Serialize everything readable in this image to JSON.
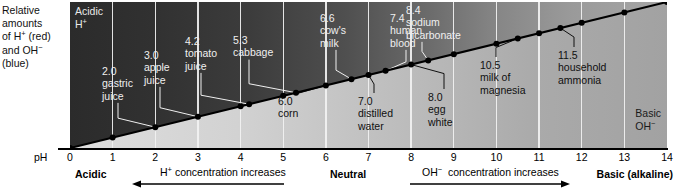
{
  "side_caption": {
    "lines": [
      "Relative",
      "amounts",
      "of H+ (red)",
      "and OH-",
      "(blue)"
    ]
  },
  "panel": {
    "acidic_corner": {
      "line1": "Acidic",
      "line2": "H+"
    },
    "basic_corner": {
      "line1": "Basic",
      "line2": "OH-"
    }
  },
  "axis": {
    "label": "pH",
    "ticks": [
      "0",
      "1",
      "2",
      "3",
      "4",
      "5",
      "6",
      "7",
      "8",
      "9",
      "10",
      "11",
      "12",
      "13",
      "14"
    ]
  },
  "legend": {
    "acidic": "Acidic",
    "neutral": "Neutral",
    "basic": "Basic (alkaline)",
    "h_plus_text": "H+ concentration increases",
    "oh_minus_text": "OH- concentration increases",
    "h_plus_direction": "left",
    "oh_minus_direction": "right"
  },
  "colors": {
    "acid_dark": "#2b2b2b",
    "base_light": "#dedede",
    "gridline": "#f2f2f2",
    "line": "#000000"
  },
  "chart_data": {
    "type": "line",
    "xlabel": "pH",
    "ylabel": "Relative amounts of H+ (red) and OH- (blue)",
    "xlim": [
      0,
      14
    ],
    "ylim": [
      0,
      1
    ],
    "grid": true,
    "legend_position": "bottom",
    "x": [
      0,
      1,
      2,
      3,
      4,
      5,
      6,
      7,
      8,
      9,
      10,
      11,
      12,
      13,
      14
    ],
    "values": [
      0.0,
      0.0714,
      0.1429,
      0.2143,
      0.2857,
      0.3571,
      0.4286,
      0.5,
      0.5714,
      0.6429,
      0.7143,
      0.7857,
      0.8571,
      0.9286,
      1.0
    ],
    "annotations": [
      {
        "ph": "2.0",
        "name": "gastric juice",
        "label_lines": [
          "2.0",
          "gastric",
          "juice"
        ],
        "side": "above"
      },
      {
        "ph": "3.0",
        "name": "apple juice",
        "label_lines": [
          "3.0",
          "apple",
          "juice"
        ],
        "side": "above"
      },
      {
        "ph": "4.2",
        "name": "tomato juice",
        "label_lines": [
          "4.2",
          "tomato",
          "juice"
        ],
        "side": "above"
      },
      {
        "ph": "5.3",
        "name": "cabbage",
        "label_lines": [
          "5.3",
          "cabbage"
        ],
        "side": "above"
      },
      {
        "ph": "6.0",
        "name": "corn",
        "label_lines": [
          "6.0",
          "corn"
        ],
        "side": "below"
      },
      {
        "ph": "6.6",
        "name": "cow's milk",
        "label_lines": [
          "6.6",
          "cow's",
          "milk"
        ],
        "side": "above"
      },
      {
        "ph": "7.0",
        "name": "distilled water",
        "label_lines": [
          "7.0",
          "distilled",
          "water"
        ],
        "side": "below"
      },
      {
        "ph": "7.4",
        "name": "human blood",
        "label_lines": [
          "7.4",
          "human",
          "blood"
        ],
        "side": "above"
      },
      {
        "ph": "8.0",
        "name": "egg white",
        "label_lines": [
          "8.0",
          "egg",
          "white"
        ],
        "side": "below"
      },
      {
        "ph": "8.4",
        "name": "sodium bicarbonate",
        "label_lines": [
          "8.4",
          "sodium",
          "bicarbonate"
        ],
        "side": "above"
      },
      {
        "ph": "10.5",
        "name": "milk of magnesia",
        "label_lines": [
          "10.5",
          "milk of",
          "magnesia"
        ],
        "side": "below"
      },
      {
        "ph": "11.5",
        "name": "household ammonia",
        "label_lines": [
          "11.5",
          "household",
          "ammonia"
        ],
        "side": "below"
      }
    ]
  }
}
